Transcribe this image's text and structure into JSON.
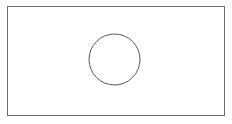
{
  "canvas": {
    "width": 232,
    "height": 124,
    "background_color": "#ffffff",
    "title": "Rectangle with inscribed circle"
  },
  "chart_data": {
    "type": "diagram",
    "title": "",
    "shapes": [
      {
        "name": "outer-rectangle",
        "kind": "rectangle",
        "x": 7,
        "y": 6,
        "width": 218,
        "height": 110,
        "stroke_color": "#6e6e6e",
        "stroke_width": 1,
        "fill": "none",
        "label": ""
      },
      {
        "name": "inner-circle",
        "kind": "ellipse",
        "cx": 114.5,
        "cy": 59.5,
        "rx": 25.5,
        "ry": 25.5,
        "stroke_color": "#555555",
        "stroke_width": 1,
        "fill": "none",
        "label": ""
      }
    ],
    "annotations": [],
    "legend": [],
    "grid": false
  },
  "colors": {
    "background": "#ffffff",
    "rectangle_stroke": "#6e6e6e",
    "circle_stroke": "#555555"
  }
}
